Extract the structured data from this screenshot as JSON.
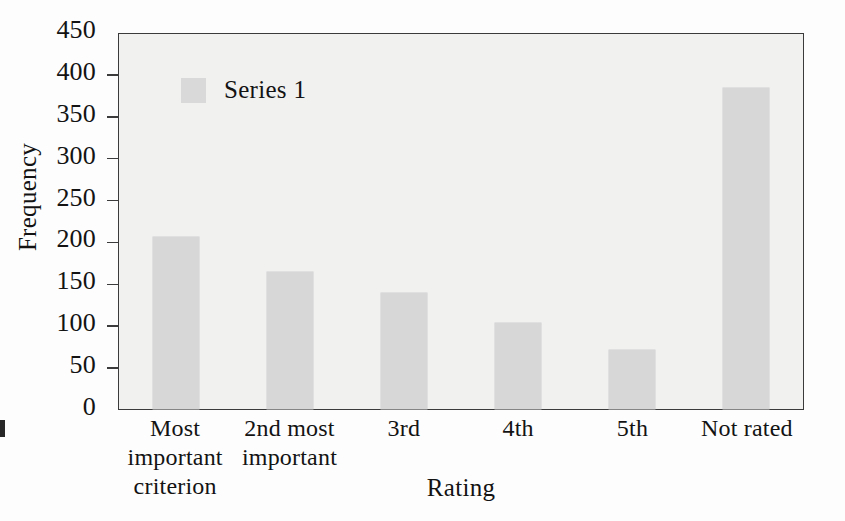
{
  "chart_data": {
    "type": "bar",
    "title": "",
    "xlabel": "Rating",
    "ylabel": "Frequency",
    "categories": [
      "Most important criterion",
      "2nd most important",
      "3rd",
      "4th",
      "5th",
      "Not rated"
    ],
    "category_lines": [
      [
        "Most",
        "important",
        "criterion"
      ],
      [
        "2nd most",
        "important"
      ],
      [
        "3rd"
      ],
      [
        "4th"
      ],
      [
        "5th"
      ],
      [
        "Not rated"
      ]
    ],
    "series": [
      {
        "name": "Series 1",
        "values": [
          205,
          163,
          138,
          103,
          71,
          383
        ]
      }
    ],
    "values": [
      205,
      163,
      138,
      103,
      71,
      383
    ],
    "ylim": [
      0,
      450
    ],
    "ytick_values": [
      0,
      50,
      100,
      150,
      200,
      250,
      300,
      350,
      400,
      450
    ],
    "ytick_labels": [
      "0",
      "50",
      "100",
      "150",
      "200",
      "250",
      "300",
      "350",
      "400",
      "450"
    ],
    "grid": false,
    "legend": {
      "position": "top-left-inside",
      "entries": [
        "Series 1"
      ]
    },
    "colors": {
      "bar": "#d7d7d7",
      "plot_background": "#f1f1f0",
      "axis": "#3b3b3b",
      "text": "#131313",
      "page_background": "#fdfdfd"
    }
  },
  "legend": {
    "series_1_label": "Series 1",
    "swatch_name": "legend-color-swatch"
  },
  "axes": {
    "y_title": "Frequency",
    "x_title": "Rating"
  },
  "background_text": {
    "note": "faint bleed-through from reverse of scanned page",
    "lines": [
      "the other side of the page shows through faintly here",
      "and these characters remain largely illegible in scan",
      "because the printing press ink bled through the sheet",
      "leaving only ghosted shapes behind the plotted figure",
      "in this particular reproduction of the original chart",
      "so none of the words can be reliably transcribed now",
      "they appear as light gray smudges across the surface",
      "beneath the bars and inside the surrounding axis box",
      "forming irregular rows of indistinct serif lettering",
      "that follow the baseline grid of the reversed page",
      "and continue downward toward the horizontal axis",
      "until the lower border of the chart frame is reached"
    ]
  }
}
